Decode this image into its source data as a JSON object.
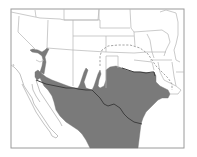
{
  "map": {
    "type": "species-range-map",
    "region": "Southwestern United States and Mexico",
    "colors": {
      "background": "#ffffff",
      "frame": "#9a9a9a",
      "state_lines": "#b4b4b4",
      "range_fill": "#7a7a7a",
      "international_border": "#3e3e3e",
      "dashed_boundary": "#9a9a9a"
    },
    "layers": [
      {
        "id": "state-boundaries",
        "style": "thin gray lines"
      },
      {
        "id": "range-shaded",
        "style": "solid gray fill"
      },
      {
        "id": "us-mexico-border",
        "style": "dark line"
      },
      {
        "id": "extended-range-boundary",
        "style": "dashed line"
      }
    ]
  }
}
